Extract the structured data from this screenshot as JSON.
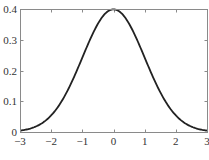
{
  "chart_data": {
    "type": "line",
    "title": "",
    "xlabel": "",
    "ylabel": "",
    "xlim": [
      -3,
      3
    ],
    "ylim": [
      0,
      0.4
    ],
    "grid": false,
    "legend": null,
    "x_ticks": [
      -3,
      -2,
      -1,
      0,
      1,
      2,
      3
    ],
    "x_tick_labels": [
      "−3",
      "−2",
      "−1",
      "0",
      "1",
      "2",
      "3"
    ],
    "y_ticks": [
      0,
      0.1,
      0.2,
      0.3,
      0.4
    ],
    "y_tick_labels": [
      "0",
      "0.1",
      "0.2",
      "0.3",
      "0.4"
    ],
    "series": [
      {
        "name": "standard normal pdf",
        "function": "exp(-x^2/2)/sqrt(2*pi)",
        "x": [
          -3,
          -2.5,
          -2,
          -1.5,
          -1,
          -0.5,
          0,
          0.5,
          1,
          1.5,
          2,
          2.5,
          3
        ],
        "y": [
          0.0044,
          0.0175,
          0.054,
          0.1295,
          0.242,
          0.3521,
          0.3989,
          0.3521,
          0.242,
          0.1295,
          0.054,
          0.0175,
          0.0044
        ],
        "color": "#222222"
      }
    ]
  }
}
